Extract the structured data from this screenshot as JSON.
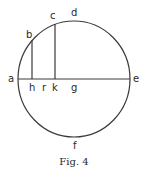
{
  "figure": {
    "caption": "Fig. 4",
    "stroke_color": "#3a3a3a",
    "circle": {
      "cx": 74,
      "cy": 79,
      "rx": 56,
      "ry": 58
    },
    "labels": {
      "a": "a",
      "b": "b",
      "c": "c",
      "d": "d",
      "e": "e",
      "f": "f",
      "g": "g",
      "h": "h",
      "k": "k",
      "r": "r"
    },
    "segments": [
      {
        "name": "diameter-ae",
        "from": "a",
        "to": "e"
      },
      {
        "name": "ordinate-bh",
        "from": "b",
        "to": "h"
      },
      {
        "name": "ordinate-ck",
        "from": "c",
        "to": "k"
      }
    ]
  }
}
